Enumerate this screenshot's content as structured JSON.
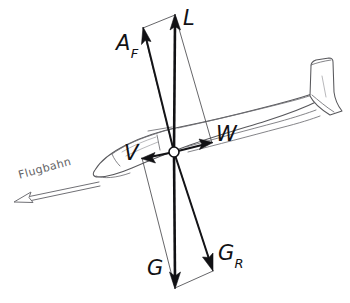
{
  "diagram": {
    "background_color": "#ffffff",
    "ink_color": "#111114",
    "outline_color": "#58585c",
    "flightpath_color": "#707075"
  },
  "labels": {
    "lift": "L",
    "total_aero_force": "A",
    "total_aero_force_sub": "F",
    "drag": "W",
    "velocity": "V",
    "weight": "G",
    "resultant_weight": "G",
    "resultant_weight_sub": "R",
    "flightpath": "Flugbahn"
  },
  "vectors": [
    {
      "name": "lift",
      "label": "L",
      "from": [
        174,
        152
      ],
      "to": [
        175,
        15
      ],
      "style": "solid-thick",
      "direction": "up"
    },
    {
      "name": "total-aerodynamic-force",
      "label": "A_F",
      "from": [
        174,
        152
      ],
      "to": [
        143,
        28
      ],
      "style": "solid-medium",
      "direction": "up-left"
    },
    {
      "name": "drag",
      "label": "W",
      "from": [
        174,
        152
      ],
      "to": [
        212,
        143
      ],
      "style": "solid-medium",
      "direction": "right"
    },
    {
      "name": "velocity",
      "label": "V",
      "from": [
        174,
        152
      ],
      "to": [
        142,
        158
      ],
      "style": "solid-medium",
      "direction": "left"
    },
    {
      "name": "weight",
      "label": "G",
      "from": [
        174,
        152
      ],
      "to": [
        175,
        288
      ],
      "style": "solid-thick",
      "direction": "down"
    },
    {
      "name": "resultant-weight",
      "label": "G_R",
      "from": [
        174,
        152
      ],
      "to": [
        213,
        271
      ],
      "style": "solid-medium",
      "direction": "down-right"
    }
  ],
  "construction": {
    "upper_parallelogram": "L + W resolve to A_F",
    "lower_parallelogram": "G + V resolve to G_R"
  },
  "flightpath": {
    "label": "Flugbahn",
    "arrow_from": [
      95,
      185
    ],
    "arrow_to": [
      14,
      202
    ],
    "arrow_style": "hollow-outline"
  },
  "hub": {
    "name": "center-of-gravity",
    "position": [
      174,
      152
    ],
    "radius": 5
  }
}
